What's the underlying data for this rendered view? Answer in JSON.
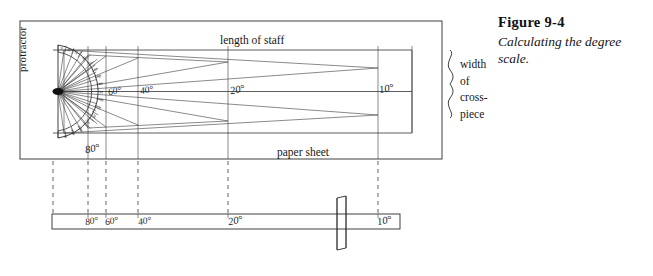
{
  "figure": {
    "caption_title": "Figure 9-4",
    "caption_text": "Calculating the degree scale."
  },
  "diagram": {
    "labels": {
      "length_of_staff": "length of staff",
      "paper_sheet": "paper sheet",
      "protractor": "protractor",
      "width_line1": "width",
      "width_line2": "of",
      "width_line3": "cross-",
      "width_line4": "piece"
    },
    "degree_marks_top": [
      {
        "label": "60°",
        "x": 110,
        "y": 93
      },
      {
        "label": "40°",
        "x": 143,
        "y": 91
      },
      {
        "label": "20°",
        "x": 234,
        "y": 90
      },
      {
        "label": "10°",
        "x": 383,
        "y": 89
      },
      {
        "label": "80°",
        "x": 88,
        "y": 148
      }
    ],
    "degree_marks_staff": [
      {
        "label": "80°",
        "x": 89,
        "y": 222
      },
      {
        "label": "60°",
        "x": 109,
        "y": 222
      },
      {
        "label": "40°",
        "x": 143,
        "y": 222
      },
      {
        "label": "20°",
        "x": 235,
        "y": 222
      },
      {
        "label": "10°",
        "x": 383,
        "y": 222
      }
    ],
    "protractor_ticks": [
      "10",
      "20",
      "30",
      "40",
      "50",
      "60",
      "70",
      "80",
      "90",
      "100",
      "110",
      "120",
      "130",
      "140",
      "150",
      "160",
      "170"
    ],
    "colors": {
      "ink": "#1a1a1a",
      "line": "#2a2a2a",
      "background": "#ffffff"
    }
  }
}
